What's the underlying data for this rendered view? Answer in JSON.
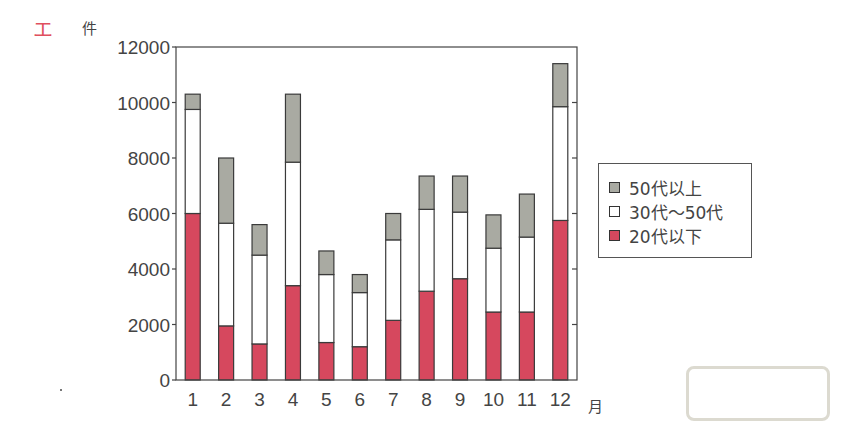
{
  "question_marker": "エ",
  "chart_data": {
    "type": "bar",
    "stacked": true,
    "title": "",
    "xlabel": "月",
    "ylabel": "件",
    "ylim": [
      0,
      12000
    ],
    "yticks": [
      0,
      2000,
      4000,
      6000,
      8000,
      10000,
      12000
    ],
    "categories": [
      "1",
      "2",
      "3",
      "4",
      "5",
      "6",
      "7",
      "8",
      "9",
      "10",
      "11",
      "12"
    ],
    "series": [
      {
        "name": "20代以下",
        "color": "#d6485e",
        "values": [
          6000,
          1950,
          1300,
          3400,
          1350,
          1200,
          2150,
          3200,
          3650,
          2450,
          2450,
          5750
        ]
      },
      {
        "name": "30代～50代",
        "color": "#ffffff",
        "values": [
          3750,
          3700,
          3200,
          4450,
          2450,
          1950,
          2900,
          2950,
          2400,
          2300,
          2700,
          4100
        ]
      },
      {
        "name": "50代以上",
        "color": "#a9aaa2",
        "values": [
          550,
          2350,
          1100,
          2450,
          850,
          650,
          950,
          1200,
          1300,
          1200,
          1550,
          1550
        ]
      }
    ],
    "totals": [
      10300,
      8000,
      5600,
      10300,
      4650,
      3800,
      6000,
      7350,
      7350,
      5950,
      6700,
      11400
    ],
    "legend": {
      "position": "right",
      "entries": [
        "50代以上",
        "30代～50代",
        "20代以下"
      ]
    },
    "grid": false
  },
  "legend_labels": [
    "50代以上",
    "30代～50代",
    "20代以下"
  ],
  "answer_box": ""
}
